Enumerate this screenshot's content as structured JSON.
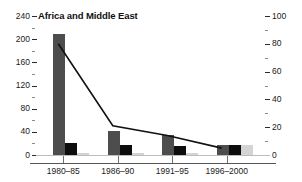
{
  "chart_data": {
    "type": "bar",
    "title": "Africa and Middle East",
    "xlabel": "",
    "ylabel": "",
    "grid": false,
    "legend_position": "none",
    "categories": [
      "1980–85",
      "1986–90",
      "1991–95",
      "1996–2000"
    ],
    "left_axis": {
      "ylim": [
        0,
        240
      ],
      "ticks": [
        0,
        40,
        80,
        120,
        160,
        200,
        240
      ],
      "tick_labels": [
        "0",
        "40",
        "80",
        "120",
        "160",
        "200",
        "240"
      ],
      "minor_ticks": [
        20,
        60,
        100,
        140,
        180,
        220
      ]
    },
    "right_axis": {
      "ylim": [
        0,
        100
      ],
      "ticks": [
        0,
        20,
        40,
        60,
        80,
        100
      ],
      "tick_labels": [
        "0",
        "20",
        "40",
        "60",
        "80",
        "100"
      ],
      "minor_ticks": [
        10,
        30,
        50,
        70,
        90
      ]
    },
    "series": [
      {
        "name": "bar-series-dark",
        "axis": "left",
        "type": "bar",
        "color": "#4d4d4d",
        "values": [
          209,
          42,
          35,
          18
        ]
      },
      {
        "name": "bar-series-black",
        "axis": "left",
        "type": "bar",
        "color": "#0d0d0d",
        "values": [
          20,
          18,
          15,
          18
        ]
      },
      {
        "name": "bar-series-light",
        "axis": "left",
        "type": "bar",
        "color": "#d4d4d4",
        "values": [
          3,
          3,
          3,
          17
        ]
      },
      {
        "name": "line-series",
        "axis": "right",
        "type": "line",
        "color": "#111111",
        "values": [
          80,
          21,
          14,
          5
        ]
      }
    ]
  }
}
